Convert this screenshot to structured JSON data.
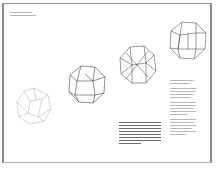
{
  "document": {
    "type": "book-spread",
    "header_lines": 2,
    "figures": [
      "polyhedron-1",
      "polyhedron-2",
      "polyhedron-3",
      "polyhedron-4"
    ],
    "page_left": "",
    "page_right": ""
  }
}
